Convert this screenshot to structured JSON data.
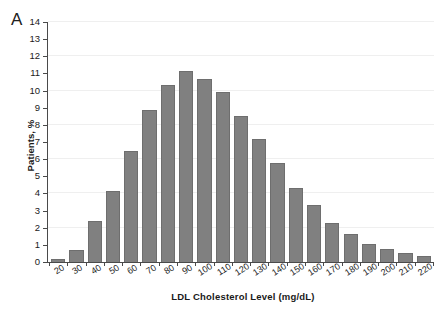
{
  "panel": {
    "letter": "A"
  },
  "chart_data": {
    "type": "bar",
    "title": "",
    "subtitle": "",
    "xlabel": "LDL Cholesterol Level (mg/dL)",
    "ylabel": "Patients, %",
    "categories": [
      "20",
      "30",
      "40",
      "50",
      "60",
      "70",
      "80",
      "90",
      "100",
      "110",
      "120",
      "130",
      "140",
      "150",
      "160",
      "170",
      "180",
      "190",
      "200",
      "210",
      "220"
    ],
    "values": [
      0.2,
      0.7,
      2.4,
      4.15,
      6.5,
      8.85,
      10.35,
      11.15,
      10.65,
      9.9,
      8.5,
      7.15,
      5.75,
      4.3,
      3.3,
      2.25,
      1.65,
      1.05,
      0.75,
      0.55,
      0.35
    ],
    "ylim": [
      0,
      14
    ],
    "ytick_labels": [
      "0",
      "1",
      "2",
      "3",
      "4",
      "5",
      "6",
      "7",
      "8",
      "9",
      "10",
      "11",
      "12",
      "13",
      "14"
    ],
    "ytick_step": 1,
    "grid": "horizontal-faint",
    "legend": "none",
    "bar_color": "#808080",
    "axis_color": "#4a4a4a",
    "grid_color": "#efefef"
  }
}
